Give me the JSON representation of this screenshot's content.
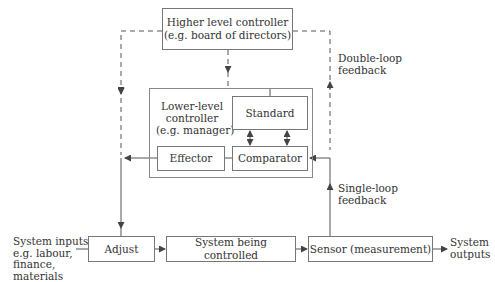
{
  "diagram": {
    "higher_controller": {
      "line1": "Higher level controller",
      "line2": "(e.g. board of directors)"
    },
    "lower_controller": {
      "line1": "Lower-level",
      "line2": "controller",
      "line3": "(e.g. manager)"
    },
    "standard": "Standard",
    "effector": "Effector",
    "comparator": "Comparator",
    "adjust": "Adjust",
    "system_controlled": "System being controlled",
    "sensor": "Sensor (measurement)",
    "double_loop": {
      "line1": "Double-loop",
      "line2": "feedback"
    },
    "single_loop": {
      "line1": "Single-loop",
      "line2": "feedback"
    },
    "inputs": {
      "line1": "System inputs",
      "line2": "e.g. labour,",
      "line3": "finance,",
      "line4": "materials"
    },
    "outputs": {
      "line1": "System",
      "line2": "outputs"
    },
    "colors": {
      "line": "#555555",
      "box_border": "#777777"
    }
  }
}
